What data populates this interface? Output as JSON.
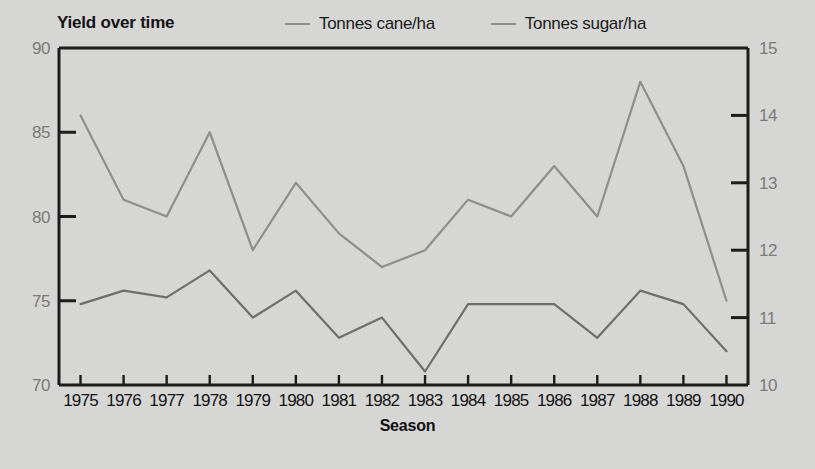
{
  "chart_data": {
    "type": "line",
    "title": "Yield over time",
    "xlabel": "Season",
    "ylabel": "",
    "grid": false,
    "legend_position": "top",
    "x": [
      "1975",
      "1976",
      "1977",
      "1978",
      "1979",
      "1980",
      "1981",
      "1982",
      "1983",
      "1984",
      "1985",
      "1986",
      "1987",
      "1988",
      "1989",
      "1990"
    ],
    "categories": [
      "1975",
      "1976",
      "1977",
      "1978",
      "1979",
      "1980",
      "1981",
      "1982",
      "1983",
      "1984",
      "1985",
      "1986",
      "1987",
      "1988",
      "1989",
      "1990"
    ],
    "left_axis": {
      "label": "",
      "ylim": [
        70,
        90
      ],
      "ticks": [
        "70",
        "75",
        "80",
        "85",
        "90"
      ],
      "tick_values": [
        70,
        75,
        80,
        85,
        90
      ]
    },
    "right_axis": {
      "label": "",
      "ylim": [
        10,
        15
      ],
      "ticks": [
        "10",
        "11",
        "12",
        "13",
        "14",
        "15"
      ],
      "tick_values": [
        10,
        11,
        12,
        13,
        14,
        15
      ]
    },
    "series": [
      {
        "name": "Tonnes cane/ha",
        "axis": "left",
        "color": "#8e8e8e",
        "values": [
          86,
          81,
          80,
          85,
          78,
          82,
          79,
          77,
          78,
          81,
          80,
          83,
          80,
          88,
          83,
          75
        ]
      },
      {
        "name": "Tonnes sugar/ha",
        "axis": "right",
        "color": "#6e6e6e",
        "values": [
          11.2,
          11.4,
          11.3,
          11.7,
          11.0,
          11.4,
          10.7,
          11.0,
          10.2,
          11.2,
          11.2,
          11.2,
          10.7,
          11.4,
          11.2,
          10.5
        ]
      }
    ]
  },
  "chart": {
    "title": "Yield over time",
    "x_axis_title": "Season",
    "legend": [
      {
        "label": "Tonnes cane/ha"
      },
      {
        "label": "Tonnes sugar/ha"
      }
    ],
    "left_ticks": [
      "90",
      "85",
      "80",
      "75",
      "70"
    ],
    "right_ticks": [
      "15",
      "14",
      "13",
      "12",
      "11",
      "10"
    ],
    "x_ticks": [
      "1975",
      "1976",
      "1977",
      "1978",
      "1979",
      "1980",
      "1981",
      "1982",
      "1983",
      "1984",
      "1985",
      "1986",
      "1987",
      "1988",
      "1989",
      "1990"
    ],
    "colors": {
      "background": "#d6d6d4",
      "frame": "#1c1c1c",
      "cane_line": "#8e8e8e",
      "sugar_line": "#6e6e6e",
      "axis_text": "#7a7a78",
      "tick_text": "#121212"
    }
  }
}
